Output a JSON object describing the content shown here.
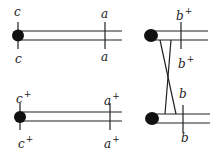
{
  "panels": [
    {
      "id": "top-left",
      "end_label_top": "c",
      "end_label_bottom": "c",
      "mark_label_top": "a",
      "mark_label_bottom": "a"
    },
    {
      "id": "bottom-left",
      "end_label_top": "c",
      "end_label_top_sup": "+",
      "end_label_bottom": "c",
      "end_label_bottom_sup": "+",
      "mark_label_top": "a",
      "mark_label_top_sup": "+",
      "mark_label_bottom": "a",
      "mark_label_bottom_sup": "+"
    },
    {
      "id": "right-top",
      "mark_label_top": "b",
      "mark_label_top_sup": "+",
      "mark_label_bottom": "b",
      "mark_label_bottom_sup": "+"
    },
    {
      "id": "right-bottom",
      "mark_label_top": "b",
      "mark_label_bottom": "b"
    }
  ],
  "colors": {
    "stroke": "#222222",
    "centromere": "#111111"
  }
}
